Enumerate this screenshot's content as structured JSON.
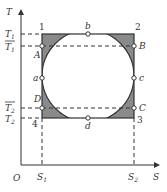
{
  "diagram": {
    "type": "T-S diagram",
    "axes": {
      "y_label": "T",
      "x_label": "S",
      "origin_label": "O"
    },
    "y_ticks": [
      {
        "label": "T",
        "sub": "1",
        "overline": false
      },
      {
        "label": "T",
        "sub": "1",
        "overline": true
      },
      {
        "label": "T",
        "sub": "2",
        "overline": true
      },
      {
        "label": "T",
        "sub": "2",
        "overline": false
      }
    ],
    "x_ticks": [
      {
        "label": "S",
        "sub": "1"
      },
      {
        "label": "S",
        "sub": "2"
      }
    ],
    "corners": [
      "1",
      "2",
      "3",
      "4"
    ],
    "points": [
      "A",
      "B",
      "C",
      "D",
      "a",
      "b",
      "c",
      "d"
    ],
    "colors": {
      "line": "#333333",
      "shade": "#8a8a8a",
      "background": "#ffffff"
    }
  }
}
